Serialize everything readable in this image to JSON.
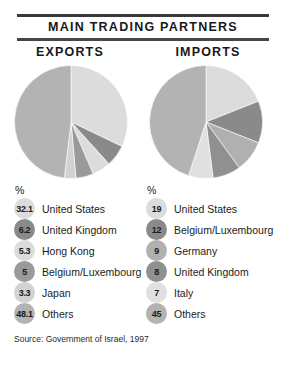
{
  "header": {
    "title": "MAIN TRADING PARTNERS"
  },
  "columns": {
    "exports_label": "EXPORTS",
    "imports_label": "IMPORTS"
  },
  "legend": {
    "percent_symbol": "%"
  },
  "footer": {
    "source": "Source: Government of Israel, 1997"
  },
  "palette": {
    "slice_very_light": "#dcdcdc",
    "slice_light": "#c9c9c9",
    "slice_medium": "#b3b3b3",
    "slice_medium_dark": "#9a9a9a",
    "slice_dark": "#8a8a8a",
    "rule": "#3a3a3c",
    "text": "#1b1b1b"
  },
  "chart_data": [
    {
      "type": "pie",
      "title": "EXPORTS",
      "ylabel": "",
      "xlabel": "",
      "unit": "%",
      "start_angle_oclock": 12,
      "direction": "clockwise",
      "categories": [
        "United States",
        "United Kingdom",
        "Hong Kong",
        "Belgium/Luxembourg",
        "Japan",
        "Others"
      ],
      "values": [
        32.1,
        6.2,
        5.3,
        5,
        3.3,
        48.1
      ],
      "value_labels": [
        "32.1",
        "6.2",
        "5.3",
        "5",
        "3.3",
        "48.1"
      ],
      "colors": [
        "#dcdcdc",
        "#8a8a8a",
        "#dcdcdc",
        "#9a9a9a",
        "#d2d2d2",
        "#b3b3b3"
      ],
      "legend_position": "below"
    },
    {
      "type": "pie",
      "title": "IMPORTS",
      "ylabel": "",
      "xlabel": "",
      "unit": "%",
      "start_angle_oclock": 12,
      "direction": "clockwise",
      "categories": [
        "United States",
        "Belgium/Luxembourg",
        "Germany",
        "United Kingdom",
        "Italy",
        "Others"
      ],
      "values": [
        19,
        12,
        9,
        8,
        7,
        45
      ],
      "value_labels": [
        "19",
        "12",
        "9",
        "8",
        "7",
        "45"
      ],
      "colors": [
        "#dcdcdc",
        "#8a8a8a",
        "#b0b0b0",
        "#909090",
        "#e0e0e0",
        "#b3b3b3"
      ],
      "legend_position": "below"
    }
  ]
}
